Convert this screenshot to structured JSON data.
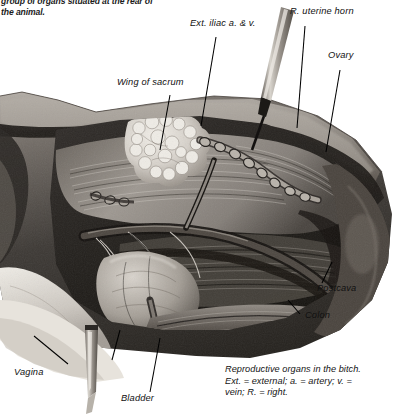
{
  "page": {
    "width": 398,
    "height": 420,
    "background": "#ffffff",
    "ink": "#111111"
  },
  "intro": {
    "text": "group of organs situated at the rear of\nthe animal."
  },
  "figure": {
    "kind": "anatomical-photograph",
    "palette": {
      "paper": "#ffffff",
      "tissue_light": "#cfcac4",
      "tissue_mid": "#8d8781",
      "tissue_dark": "#4a4641",
      "tissue_deep": "#221f1c",
      "highlight": "#e9e5df",
      "probe_metal": "#b9b4ad"
    },
    "labels": [
      {
        "id": "ext-iliac",
        "text": "Ext. iliac a. & v.",
        "x": 190,
        "y": 25
      },
      {
        "id": "r-uterine-horn",
        "text": "R. uterine horn",
        "x": 290,
        "y": 13
      },
      {
        "id": "ovary",
        "text": "Ovary",
        "x": 328,
        "y": 57
      },
      {
        "id": "wing-of-sacrum",
        "text": "Wing of sacrum",
        "x": 117,
        "y": 84
      },
      {
        "id": "postcava",
        "text": "Postcava",
        "x": 317,
        "y": 290
      },
      {
        "id": "colon",
        "text": "Colon",
        "x": 305,
        "y": 317
      },
      {
        "id": "vagina",
        "text": "Vagina",
        "x": 14,
        "y": 374
      },
      {
        "id": "bladder",
        "text": "Bladder",
        "x": 121,
        "y": 400
      }
    ]
  },
  "caption": {
    "text": "Reproductive organs in the bitch.\nExt. = external; a. = artery; v. =\nvein; R. = right."
  }
}
